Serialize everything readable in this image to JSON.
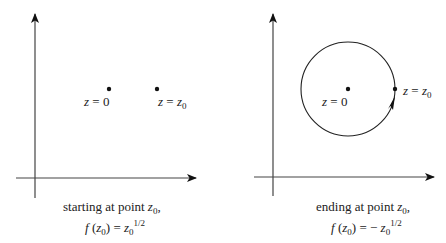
{
  "panels": [
    {
      "id": "left",
      "point_origin_label": {
        "var": "z",
        "eq": "=",
        "val": "0"
      },
      "point_z0_label": {
        "var": "z",
        "eq": "=",
        "val": "z",
        "sub": "0"
      },
      "caption_line1": {
        "text": "starting at point ",
        "var": "z",
        "sub": "0",
        "trail": ","
      },
      "caption_line2": {
        "f": "f",
        "open": "(",
        "var": "z",
        "sub": "0",
        "close": ")",
        "eq": "=",
        "sign": "",
        "rhs_var": "z",
        "rhs_sub": "0",
        "exp": "1/2"
      }
    },
    {
      "id": "right",
      "point_origin_label": {
        "var": "z",
        "eq": "=",
        "val": "0"
      },
      "point_z0_label": {
        "var": "z",
        "eq": "=",
        "val": "z",
        "sub": "0"
      },
      "caption_line1": {
        "text": "ending at point ",
        "var": "z",
        "sub": "0",
        "trail": ","
      },
      "caption_line2": {
        "f": "f",
        "open": "(",
        "var": "z",
        "sub": "0",
        "close": ")",
        "eq": "=",
        "sign": "− ",
        "rhs_var": "z",
        "rhs_sub": "0",
        "exp": "1/2"
      }
    }
  ],
  "colors": {
    "stroke": "#222222",
    "axis": "#444444",
    "background": "#ffffff"
  }
}
